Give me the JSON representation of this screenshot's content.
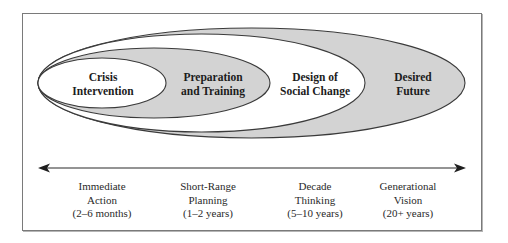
{
  "diagram": {
    "type": "nested-ellipses-timeline",
    "colors": {
      "gray_fill": "#d3d3d3",
      "white_fill": "#ffffff",
      "stroke": "#3a3a3a",
      "frame": "#7a7a7a"
    },
    "ellipses": [
      {
        "id": "desired-future",
        "label_lines": [
          "Desired",
          "Future"
        ],
        "fill": "gray"
      },
      {
        "id": "design-of-social-change",
        "label_lines": [
          "Design of",
          "Social Change"
        ],
        "fill": "white"
      },
      {
        "id": "preparation-and-training",
        "label_lines": [
          "Preparation",
          "and Training"
        ],
        "fill": "gray"
      },
      {
        "id": "crisis-intervention",
        "label_lines": [
          "Crisis",
          "Intervention"
        ],
        "fill": "white"
      }
    ],
    "timeline": {
      "arrow": "double-headed",
      "stages": [
        {
          "lines": [
            "Immediate",
            "Action",
            "(2–6 months)"
          ]
        },
        {
          "lines": [
            "Short-Range",
            "Planning",
            "(1–2 years)"
          ]
        },
        {
          "lines": [
            "Decade",
            "Thinking",
            "(5–10 years)"
          ]
        },
        {
          "lines": [
            "Generational",
            "Vision",
            "(20+ years)"
          ]
        }
      ]
    }
  }
}
